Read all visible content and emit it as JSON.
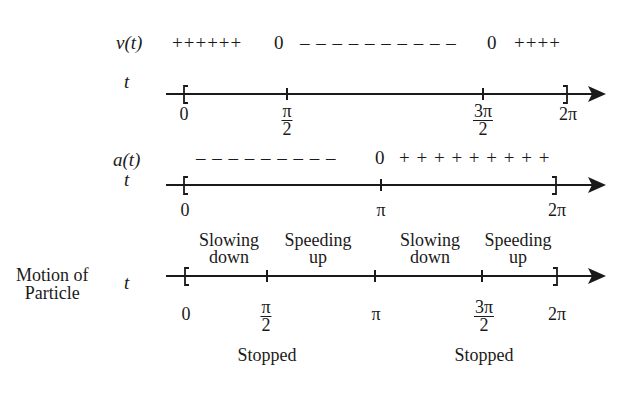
{
  "velocity_row": {
    "label": "v(t)",
    "signs": [
      {
        "text": "++++++",
        "x": 172
      },
      {
        "text": "0",
        "x": 274
      },
      {
        "text": "– – – – – – – – – –",
        "x": 302
      },
      {
        "text": "0",
        "x": 487
      },
      {
        "text": "++++",
        "x": 515
      }
    ]
  },
  "axis1": {
    "variable": "t",
    "ticks": [
      {
        "label": "0",
        "x": 184,
        "type": "open-bracket"
      },
      {
        "label_num": "π",
        "label_den": "2",
        "x": 287,
        "type": "tick"
      },
      {
        "label_num": "3π",
        "label_den": "2",
        "x": 483,
        "type": "tick"
      },
      {
        "label": "2π",
        "x": 567,
        "type": "close-bracket"
      }
    ]
  },
  "acceleration_row": {
    "label": "a(t)",
    "signs": [
      {
        "text": "– – – – – – – – –",
        "x": 196
      },
      {
        "text": "0",
        "x": 375
      },
      {
        "text": "+ + + + + + + + +",
        "x": 400
      }
    ]
  },
  "axis2": {
    "variable": "t",
    "ticks": [
      {
        "label": "0",
        "x": 184,
        "type": "open-bracket"
      },
      {
        "label": "π",
        "x": 381,
        "type": "tick"
      },
      {
        "label": "2π",
        "x": 556,
        "type": "close-bracket"
      }
    ]
  },
  "motion_row": {
    "side_label_line1": "Motion of",
    "side_label_line2": "Particle",
    "variable": "t",
    "intervals": [
      {
        "line1": "Slowing",
        "line2": "down",
        "x": 225
      },
      {
        "line1": "Speeding",
        "line2": "up",
        "x": 321
      },
      {
        "line1": "Slowing",
        "line2": "down",
        "x": 430
      },
      {
        "line1": "Speeding",
        "line2": "up",
        "x": 519
      }
    ],
    "ticks": [
      {
        "label": "0",
        "x": 185,
        "type": "open-bracket"
      },
      {
        "label_num": "π",
        "label_den": "2",
        "x": 267,
        "type": "tick"
      },
      {
        "label": "π",
        "x": 375,
        "type": "tick"
      },
      {
        "label_num": "3π",
        "label_den": "2",
        "x": 482,
        "type": "tick"
      },
      {
        "label": "2π",
        "x": 557,
        "type": "close-bracket"
      }
    ],
    "stopped": [
      {
        "text": "Stopped",
        "x": 267
      },
      {
        "text": "Stopped",
        "x": 482
      }
    ]
  }
}
